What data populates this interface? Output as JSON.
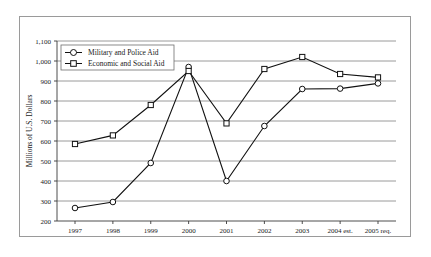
{
  "chart_data": {
    "type": "line",
    "title": "",
    "xlabel": "",
    "ylabel": "Millions of U.S. Dollars",
    "categories": [
      "1997",
      "1998",
      "1999",
      "2000",
      "2001",
      "2002",
      "2003",
      "2004 est.",
      "2005 req."
    ],
    "ylim": [
      200,
      1100
    ],
    "ytick_step": 100,
    "ytick_labels": [
      "1,100",
      "1,000",
      "900",
      "800",
      "700",
      "600",
      "500",
      "400",
      "300",
      "200"
    ],
    "ytick_values": [
      1100,
      1000,
      900,
      800,
      700,
      600,
      500,
      400,
      300,
      200
    ],
    "grid": true,
    "legend_position": "top-left-inside",
    "series": [
      {
        "name": "Military and Police Aid",
        "marker": "circle",
        "values": [
          265,
          295,
          490,
          970,
          400,
          675,
          860,
          862,
          888
        ]
      },
      {
        "name": "Economic and Social Aid",
        "marker": "square",
        "values": [
          585,
          628,
          780,
          950,
          688,
          960,
          1020,
          935,
          918
        ]
      }
    ]
  },
  "legend": {
    "entries": [
      {
        "label": "Military and Police Aid",
        "marker": "circle-marker"
      },
      {
        "label": "Economic and Social Aid",
        "marker": "square-marker"
      }
    ]
  },
  "axis": {
    "y_title": "Millions of U.S. Dollars"
  }
}
